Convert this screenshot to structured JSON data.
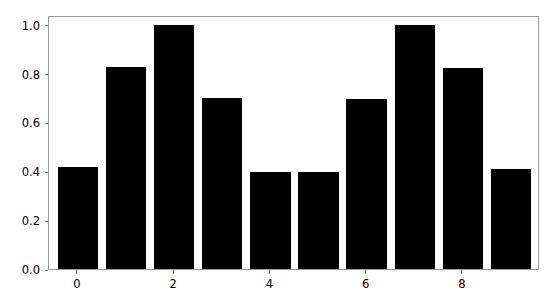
{
  "chart_data": {
    "type": "bar",
    "title": "",
    "xlabel": "",
    "ylabel": "",
    "categories": [
      "0",
      "1",
      "2",
      "3",
      "4",
      "5",
      "6",
      "7",
      "8",
      "9"
    ],
    "values": [
      0.417,
      0.826,
      1.0,
      0.7,
      0.397,
      0.397,
      0.695,
      1.0,
      0.823,
      0.41
    ],
    "xlim": [
      -0.6,
      9.6
    ],
    "ylim": [
      0.0,
      1.04
    ],
    "yticks": [
      0.0,
      0.2,
      0.4,
      0.6,
      0.8,
      1.0
    ],
    "ytick_labels": [
      "0.0",
      "0.2",
      "0.4",
      "0.6",
      "0.8",
      "1.0"
    ],
    "xticks": [
      0,
      2,
      4,
      6,
      8
    ],
    "xtick_labels": [
      "0",
      "2",
      "4",
      "6",
      "8"
    ],
    "grid": false,
    "legend": null,
    "bar_color": "#000000",
    "bar_width": 0.84,
    "spine_color": "#9a9a9a",
    "tick_color": "#6b6b6b",
    "background": "#ffffff"
  }
}
